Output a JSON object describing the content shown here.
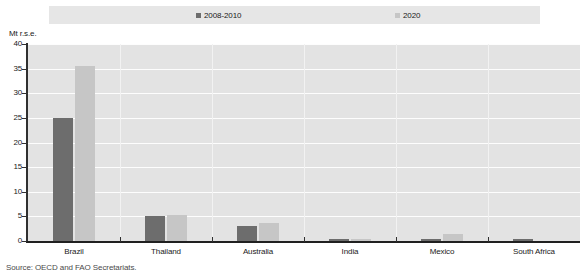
{
  "chart_data": {
    "type": "bar",
    "title": "",
    "subtitle": "",
    "xlabel": "",
    "ylabel": "Mt r.s.e.",
    "ylim": [
      0,
      40
    ],
    "yticks": [
      0,
      5,
      10,
      15,
      20,
      25,
      30,
      35,
      40
    ],
    "grid": true,
    "legend_position": "top",
    "categories": [
      "Brazil",
      "Thailand",
      "Australia",
      "India",
      "Mexico",
      "South Africa"
    ],
    "series": [
      {
        "name": "2008-2010",
        "color": "#6d6d6d",
        "values": [
          25.0,
          5.0,
          3.0,
          0.4,
          0.4,
          0.4
        ]
      },
      {
        "name": "2020",
        "color": "#c6c6c6",
        "values": [
          35.5,
          5.3,
          3.6,
          0.4,
          1.4,
          0.0
        ]
      }
    ]
  },
  "axis": {
    "unit_caption": "Mt r.s.e."
  },
  "source": {
    "note": "Source: OECD and FAO Secretariats."
  },
  "colors": {
    "series_2008_2010": "#6d6d6d",
    "series_2020": "#c6c6c6",
    "plot_background": "#e3e3e3",
    "legend_background": "#e6e6e6",
    "gridline": "#fdfdfd",
    "axis": "#303030"
  }
}
